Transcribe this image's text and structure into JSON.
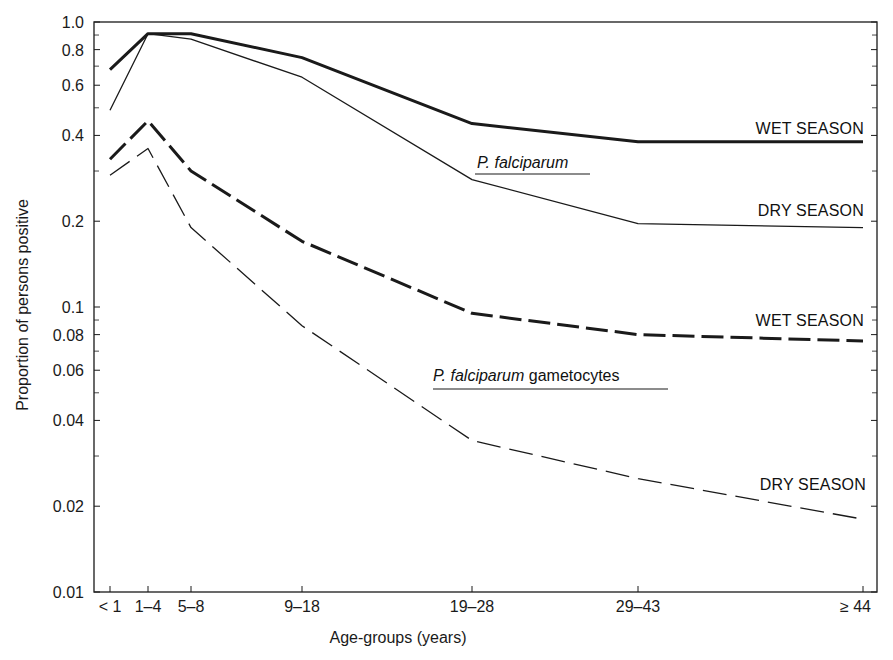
{
  "chart_data": {
    "type": "line",
    "title": "",
    "xlabel": "Age-groups (years)",
    "ylabel": "Proportion of persons positive",
    "yscale": "log",
    "ylim": [
      0.01,
      1.0
    ],
    "grid": false,
    "categories": [
      "< 1",
      "1–4",
      "5–8",
      "9–18",
      "19–28",
      "29–43",
      "≥ 44"
    ],
    "category_x": [
      110,
      148,
      191,
      302,
      472,
      638,
      863
    ],
    "y_ticks": [
      {
        "value": 1.0,
        "label": "1.0"
      },
      {
        "value": 0.8,
        "label": "0.8"
      },
      {
        "value": 0.6,
        "label": "0.6"
      },
      {
        "value": 0.4,
        "label": "0.4"
      },
      {
        "value": 0.2,
        "label": "0.2"
      },
      {
        "value": 0.1,
        "label": "0.1"
      },
      {
        "value": 0.08,
        "label": "0.08"
      },
      {
        "value": 0.06,
        "label": "0.06"
      },
      {
        "value": 0.04,
        "label": "0.04"
      },
      {
        "value": 0.02,
        "label": "0.02"
      },
      {
        "value": 0.01,
        "label": "0.01"
      }
    ],
    "y_minor_ticks": [
      0.9,
      0.7,
      0.5,
      0.3,
      0.09,
      0.07,
      0.05,
      0.03
    ],
    "groups": [
      {
        "label_italic": "P. falciparum",
        "label_rest": "",
        "x": 477,
        "y": 168,
        "underline": [
          475,
          590,
          174
        ]
      },
      {
        "label_italic": "P. falciparum",
        "label_rest": " gametocytes",
        "x": 433,
        "y": 381,
        "underline": [
          433,
          668,
          389
        ]
      }
    ],
    "series": [
      {
        "name": "P. falciparum — Wet season",
        "label": "WET SEASON",
        "values": [
          0.68,
          0.91,
          0.91,
          0.75,
          0.44,
          0.38,
          0.38
        ],
        "style": "solid-thick",
        "label_x": 864,
        "label_y": 134
      },
      {
        "name": "P. falciparum — Dry season",
        "label": "DRY SEASON",
        "values": [
          0.49,
          0.91,
          0.87,
          0.64,
          0.28,
          0.196,
          0.19
        ],
        "style": "solid-thin",
        "label_x": 864,
        "label_y": 216
      },
      {
        "name": "P. falciparum gametocytes — Wet season",
        "label": "WET SEASON",
        "values": [
          0.33,
          0.45,
          0.3,
          0.17,
          0.095,
          0.08,
          0.076
        ],
        "style": "dashed-thick",
        "label_x": 864,
        "label_y": 326
      },
      {
        "name": "P. falciparum gametocytes — Dry season",
        "label": "DRY SEASON",
        "values": [
          0.29,
          0.36,
          0.19,
          0.086,
          0.034,
          0.025,
          0.018
        ],
        "style": "dashed-thin",
        "label_x": 866,
        "label_y": 490
      }
    ]
  },
  "layout": {
    "plot": {
      "left": 94,
      "right": 877,
      "top": 22,
      "bottom": 592
    },
    "decade_px": 285,
    "colors": {
      "line": "#1a1a1a",
      "frame": "#2a2a2a",
      "background": "#ffffff"
    }
  }
}
